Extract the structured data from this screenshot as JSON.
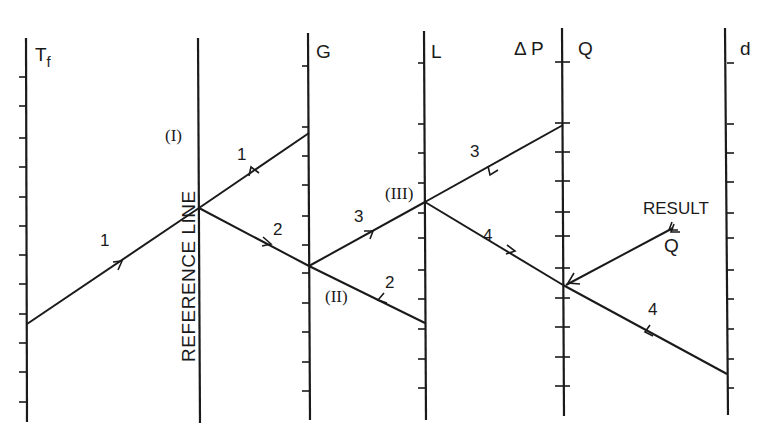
{
  "diagram": {
    "type": "nomogram",
    "axes": [
      {
        "id": "tf",
        "label": "T",
        "subscript": "f",
        "x": 26
      },
      {
        "id": "ref",
        "label": "REFERENCE LINE",
        "x": 199
      },
      {
        "id": "g",
        "label": "G",
        "x": 309
      },
      {
        "id": "l",
        "label": "L",
        "x": 425
      },
      {
        "id": "dp-q",
        "label_left": "Δ P",
        "label_right": "Q",
        "x": 563
      },
      {
        "id": "d",
        "label": "d",
        "x": 727
      }
    ],
    "pivots": [
      {
        "id": "I",
        "label": "(I)"
      },
      {
        "id": "II",
        "label": "(II)"
      },
      {
        "id": "III",
        "label": "(III)"
      }
    ],
    "steps": [
      {
        "step": "1",
        "label": "1",
        "segments": [
          "T_f → Reference line",
          "G → Reference line"
        ]
      },
      {
        "step": "2",
        "label": "2",
        "segments": [
          "Reference line → G (pivot II)",
          "L → G (pivot II)"
        ]
      },
      {
        "step": "3",
        "label": "3",
        "segments": [
          "G → L (pivot III)",
          "ΔP → L (pivot III)"
        ]
      },
      {
        "step": "4",
        "label": "4",
        "segments": [
          "L → Q",
          "d → Q"
        ]
      }
    ],
    "step_labels": {
      "s1a": "1",
      "s1b": "1",
      "s2a": "2",
      "s2b": "2",
      "s3a": "3",
      "s3b": "3",
      "s4a": "4",
      "s4b": "4"
    },
    "result": {
      "label": "RESULT",
      "value_label": "Q"
    }
  }
}
